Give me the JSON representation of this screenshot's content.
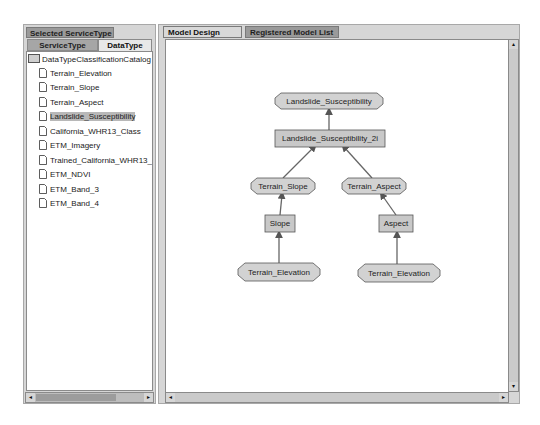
{
  "left_panel": {
    "title": "Selected ServiceType",
    "tabs": [
      {
        "label": "ServiceType",
        "active": false
      },
      {
        "label": "DataType",
        "active": true
      }
    ],
    "tree": {
      "root": "DataTypeClassificationCatalog",
      "items": [
        {
          "label": "Terrain_Elevation",
          "selected": false
        },
        {
          "label": "Terrain_Slope",
          "selected": false
        },
        {
          "label": "Terrain_Aspect",
          "selected": false
        },
        {
          "label": "Landslide_Susceptibility",
          "selected": true
        },
        {
          "label": "California_WHR13_Class",
          "selected": false
        },
        {
          "label": "ETM_Imagery",
          "selected": false
        },
        {
          "label": "Trained_California_WHR13_P",
          "selected": false
        },
        {
          "label": "ETM_NDVI",
          "selected": false
        },
        {
          "label": "ETM_Band_3",
          "selected": false
        },
        {
          "label": "ETM_Band_4",
          "selected": false
        }
      ]
    }
  },
  "right_panel": {
    "tabs": [
      {
        "label": "Model Design Panel",
        "active": true
      },
      {
        "label": "Registered Model List",
        "active": false
      }
    ],
    "diagram": {
      "nodes": [
        {
          "id": "n1",
          "label": "Landslide_Susceptibility",
          "shape": "octagon"
        },
        {
          "id": "n2",
          "label": "Landslide_Susceptibility_2i",
          "shape": "rect"
        },
        {
          "id": "n3",
          "label": "Terrain_Slope",
          "shape": "octagon"
        },
        {
          "id": "n4",
          "label": "Terrain_Aspect",
          "shape": "octagon"
        },
        {
          "id": "n5",
          "label": "Slope",
          "shape": "rect"
        },
        {
          "id": "n6",
          "label": "Aspect",
          "shape": "rect"
        },
        {
          "id": "n7",
          "label": "Terrain_Elevation",
          "shape": "octagon"
        },
        {
          "id": "n8",
          "label": "Terrain_Elevation",
          "shape": "octagon"
        }
      ],
      "edges": [
        {
          "from": "n2",
          "to": "n1"
        },
        {
          "from": "n3",
          "to": "n2"
        },
        {
          "from": "n4",
          "to": "n2"
        },
        {
          "from": "n5",
          "to": "n3"
        },
        {
          "from": "n6",
          "to": "n4"
        },
        {
          "from": "n7",
          "to": "n5"
        },
        {
          "from": "n8",
          "to": "n6"
        }
      ]
    }
  },
  "icons": {
    "scroll_left": "◂",
    "scroll_right": "▸",
    "scroll_up": "▴",
    "scroll_down": "▾"
  },
  "colors": {
    "panel_bg": "#d6d6d6",
    "node_fill": "#d2d2d2",
    "selected_bg": "#b8b8b8"
  }
}
